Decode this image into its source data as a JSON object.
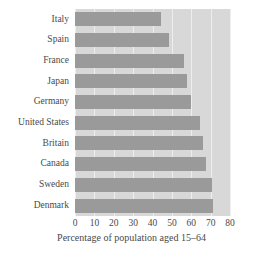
{
  "chart_data": {
    "type": "bar",
    "orientation": "horizontal",
    "title": "",
    "xlabel": "Percentage of population aged 15–64",
    "ylabel": "",
    "xlim": [
      0,
      80
    ],
    "xticks": [
      0,
      10,
      20,
      30,
      40,
      50,
      60,
      70,
      80
    ],
    "xtick_labels": [
      "0",
      "10",
      "20",
      "30",
      "40",
      "50",
      "60",
      "70",
      "80"
    ],
    "grid": true,
    "grid_axis": "x",
    "legend": false,
    "categories": [
      "Italy",
      "Spain",
      "France",
      "Japan",
      "Germany",
      "United States",
      "Britain",
      "Canada",
      "Sweden",
      "Denmark"
    ],
    "values": [
      44.5,
      48.5,
      56,
      58,
      60,
      64.5,
      66,
      67.5,
      70.5,
      71
    ],
    "series": [
      {
        "name": "Percentage of population aged 15-64",
        "values": [
          44.5,
          48.5,
          56,
          58,
          60,
          64.5,
          66,
          67.5,
          70.5,
          71
        ]
      }
    ]
  },
  "colors": {
    "bar": "#9a9a9a",
    "plot_background": "#d8d8d8",
    "gridline": "#eeeeee",
    "text": "#4a4a4a",
    "page_background": "#ffffff"
  }
}
